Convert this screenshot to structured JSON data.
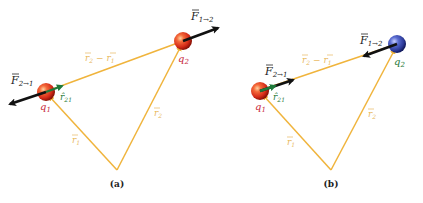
{
  "colors": {
    "vector_line": "#f0b43c",
    "vector_label": "#e8b860",
    "force_arrow": "#111111",
    "unit_vector": "#1f7a3a",
    "charge_label_red": "#c8283c",
    "charge_label_green": "#1f7a3a",
    "sphere_red": "#e03a1e",
    "sphere_blue": "#3a4fb0"
  },
  "panels": [
    {
      "caption": "(a)",
      "q1": {
        "label": "q",
        "sub": "1"
      },
      "q2": {
        "label": "q",
        "sub": "2"
      },
      "force_on_1": {
        "label": "F",
        "sub": "2→1"
      },
      "force_on_2": {
        "label": "F",
        "sub": "1→2"
      },
      "unit_vector": {
        "label": "r̂",
        "sub": "21"
      },
      "r1": {
        "label": "r",
        "sub": "1"
      },
      "r2": {
        "label": "r",
        "sub": "2"
      },
      "r2_minus_r1": {
        "a": "r",
        "a_sub": "2",
        "op": " − ",
        "b": "r",
        "b_sub": "1"
      }
    },
    {
      "caption": "(b)",
      "q1": {
        "label": "q",
        "sub": "1"
      },
      "q2": {
        "label": "q",
        "sub": "2"
      },
      "force_on_1": {
        "label": "F",
        "sub": "2→1"
      },
      "force_on_2": {
        "label": "F",
        "sub": "1→2"
      },
      "unit_vector": {
        "label": "r̂",
        "sub": "21"
      },
      "r1": {
        "label": "r",
        "sub": "1"
      },
      "r2": {
        "label": "r",
        "sub": "2"
      },
      "r2_minus_r1": {
        "a": "r",
        "a_sub": "2",
        "op": " − ",
        "b": "r",
        "b_sub": "1"
      }
    }
  ]
}
